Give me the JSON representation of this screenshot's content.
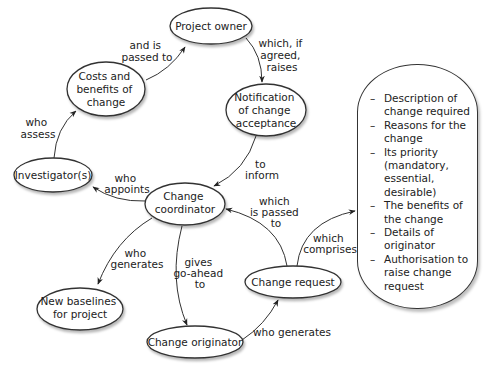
{
  "nodes": {
    "project_owner": {
      "lines": [
        "Project owner"
      ]
    },
    "costs_benefits": {
      "lines": [
        "Costs and",
        "benefits of",
        "change"
      ]
    },
    "notification": {
      "lines": [
        "Notification",
        "of change",
        "acceptance"
      ]
    },
    "investigators": {
      "lines": [
        "Investigator(s)"
      ]
    },
    "change_coordinator": {
      "lines": [
        "Change",
        "coordinator"
      ]
    },
    "new_baselines": {
      "lines": [
        "New baselines",
        "for project"
      ]
    },
    "change_originator": {
      "lines": [
        "Change originator"
      ]
    },
    "change_request": {
      "lines": [
        "Change request"
      ]
    }
  },
  "edges": {
    "costs_to_owner": {
      "lines": [
        "and is",
        "passed to"
      ]
    },
    "owner_to_notification": {
      "lines": [
        "which, if",
        "agreed,",
        "raises"
      ]
    },
    "investigator_to_costs": {
      "lines": [
        "who",
        "assess"
      ]
    },
    "notification_to_coordinator": {
      "lines": [
        "to",
        "inform"
      ]
    },
    "coordinator_to_investigator": {
      "lines": [
        "who",
        "appoints"
      ]
    },
    "request_to_coordinator": {
      "lines": [
        "which",
        "is passed",
        "to"
      ]
    },
    "coordinator_to_baselines": {
      "lines": [
        "who",
        "generates"
      ]
    },
    "coordinator_to_originator": {
      "lines": [
        "gives",
        "go-ahead",
        "to"
      ]
    },
    "originator_to_request": {
      "lines": [
        "who generates"
      ]
    },
    "request_to_list": {
      "lines": [
        "which",
        "comprises"
      ]
    }
  },
  "change_request_contents": {
    "items": [
      "Description of change required",
      "Reasons for the change",
      "Its priority (mandatory, essential, desirable)",
      "The benefits of the change",
      "Details of originator",
      "Authorisation to raise change request"
    ]
  },
  "colors": {
    "stroke": "#333333",
    "text": "#222222",
    "shadow": "#bbbbbb"
  }
}
